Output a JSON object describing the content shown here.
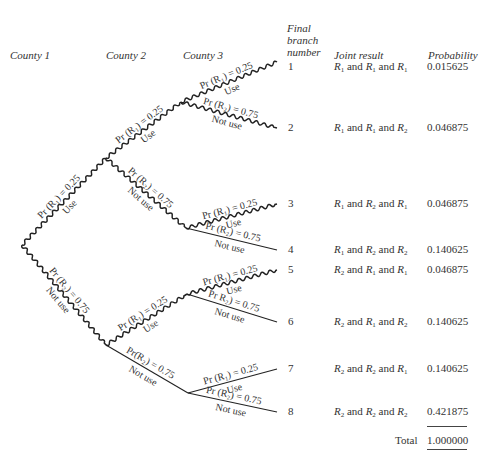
{
  "headers": {
    "county1": "County 1",
    "county2": "County 2",
    "county3": "County 3",
    "final_branch": [
      "Final",
      "branch",
      "number"
    ],
    "joint_result": "Joint result",
    "probability": "Probability"
  },
  "branch_labels": {
    "use_prob": "Pr (R₁) = 0.25",
    "notuse_prob": "Pr (R₂) = 0.75",
    "notuse_prob_alt1": "Pr R₂) = 0.75",
    "notuse_prob_alt2": "Pr(R₂) = 0.75",
    "use": "Use",
    "not_use": "Not use"
  },
  "rows": [
    {
      "branch": "1",
      "joint": [
        "R1",
        "R1",
        "R1"
      ],
      "probability": "0.015625"
    },
    {
      "branch": "2",
      "joint": [
        "R1",
        "R1",
        "R2"
      ],
      "probability": "0.046875"
    },
    {
      "branch": "3",
      "joint": [
        "R1",
        "R2",
        "R1"
      ],
      "probability": "0.046875"
    },
    {
      "branch": "4",
      "joint": [
        "R1",
        "R2",
        "R2"
      ],
      "probability": "0.140625"
    },
    {
      "branch": "5",
      "joint": [
        "R2",
        "R1",
        "R1"
      ],
      "probability": "0.046875"
    },
    {
      "branch": "6",
      "joint": [
        "R2",
        "R1",
        "R2"
      ],
      "probability": "0.140625"
    },
    {
      "branch": "7",
      "joint": [
        "R2",
        "R2",
        "R1"
      ],
      "probability": "0.140625"
    },
    {
      "branch": "8",
      "joint": [
        "R2",
        "R2",
        "R2"
      ],
      "probability": "0.421875"
    }
  ],
  "and_word": "and",
  "total_label": "Total",
  "total_value": "1.000000",
  "highlighted_paths_note": "Wavy lines mark branches where at least one R1 path continues",
  "tree": {
    "root": {
      "label": "County 1 decision"
    },
    "edges": [
      {
        "id": "c1-use",
        "from": "root",
        "to": "c2a",
        "label_top": "use_prob",
        "label_bottom": "use",
        "style": "wavy"
      },
      {
        "id": "c1-notuse",
        "from": "root",
        "to": "c2b",
        "label_top": "notuse_prob",
        "label_bottom": "not_use",
        "style": "wavy"
      },
      {
        "id": "c2a-use",
        "from": "c2a",
        "to": "c3a",
        "label_top": "use_prob",
        "label_bottom": "use",
        "style": "wavy"
      },
      {
        "id": "c2a-notuse",
        "from": "c2a",
        "to": "c3b",
        "label_top": "notuse_prob",
        "label_bottom": "not_use",
        "style": "wavy"
      },
      {
        "id": "c2b-use",
        "from": "c2b",
        "to": "c3c",
        "label_top": "use_prob",
        "label_bottom": "use",
        "style": "wavy"
      },
      {
        "id": "c2b-notuse",
        "from": "c2b",
        "to": "c3d",
        "label_top": "notuse_prob_alt2",
        "label_bottom": "not_use",
        "style": "plain"
      },
      {
        "id": "b1",
        "from": "c3a",
        "to": "end1",
        "label_top": "use_prob",
        "label_bottom": "use",
        "style": "wavy"
      },
      {
        "id": "b2",
        "from": "c3a",
        "to": "end2",
        "label_top": "notuse_prob",
        "label_bottom": "not_use",
        "style": "wavy"
      },
      {
        "id": "b3",
        "from": "c3b",
        "to": "end3",
        "label_top": "use_prob",
        "label_bottom": "use",
        "style": "wavy"
      },
      {
        "id": "b4",
        "from": "c3b",
        "to": "end4",
        "label_top": "notuse_prob",
        "label_bottom": "not_use",
        "style": "plain"
      },
      {
        "id": "b5",
        "from": "c3c",
        "to": "end5",
        "label_top": "use_prob",
        "label_bottom": "use",
        "style": "wavy"
      },
      {
        "id": "b6",
        "from": "c3c",
        "to": "end6",
        "label_top": "notuse_prob_alt1",
        "label_bottom": "not_use",
        "style": "plain"
      },
      {
        "id": "b7",
        "from": "c3d",
        "to": "end7",
        "label_top": "use_prob",
        "label_bottom": "use",
        "style": "plain"
      },
      {
        "id": "b8",
        "from": "c3d",
        "to": "end8",
        "label_top": "notuse_prob",
        "label_bottom": "not_use",
        "style": "plain"
      }
    ]
  }
}
